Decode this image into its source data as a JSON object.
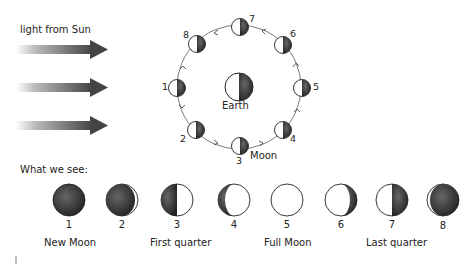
{
  "sunlight": {
    "label": "light from Sun",
    "arrows": 3
  },
  "orbit": {
    "earth_label": "Earth",
    "moon_label": "Moon",
    "positions": [
      {
        "num": "1"
      },
      {
        "num": "2"
      },
      {
        "num": "3"
      },
      {
        "num": "4"
      },
      {
        "num": "5"
      },
      {
        "num": "6"
      },
      {
        "num": "7"
      },
      {
        "num": "8"
      }
    ]
  },
  "what_we_see": {
    "heading": "What we see:",
    "phases": [
      {
        "num": "1",
        "shape": "new"
      },
      {
        "num": "2",
        "shape": "waxing-crescent"
      },
      {
        "num": "3",
        "shape": "first-quarter"
      },
      {
        "num": "4",
        "shape": "waxing-gibbous"
      },
      {
        "num": "5",
        "shape": "full"
      },
      {
        "num": "6",
        "shape": "waning-gibbous"
      },
      {
        "num": "7",
        "shape": "last-quarter"
      },
      {
        "num": "8",
        "shape": "waning-crescent"
      }
    ],
    "phase_names": [
      {
        "label": "New Moon"
      },
      {
        "label": "First quarter"
      },
      {
        "label": "Full Moon"
      },
      {
        "label": "Last quarter"
      }
    ]
  },
  "colors": {
    "dark": "#2a2a2a",
    "arrow": "#444444"
  }
}
